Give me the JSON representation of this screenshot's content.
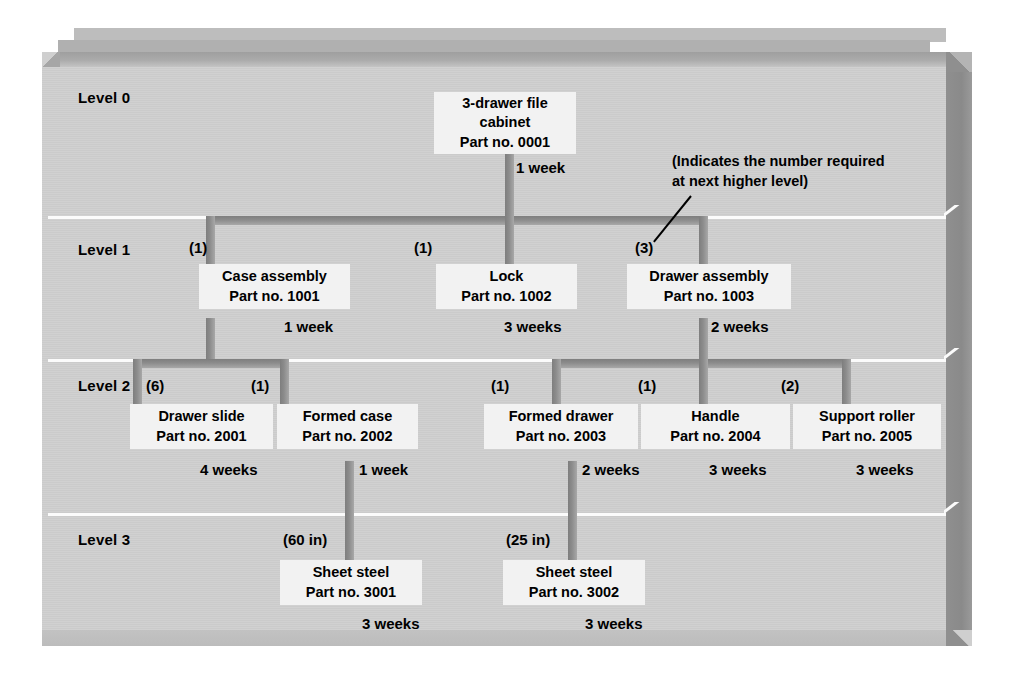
{
  "diagram": {
    "annotation": {
      "line1": "(Indicates the number required",
      "line2": "at next higher level)"
    },
    "levels": [
      {
        "label": "Level 0"
      },
      {
        "label": "Level 1"
      },
      {
        "label": "Level 2"
      },
      {
        "label": "Level 3"
      }
    ],
    "nodes": [
      {
        "id": "n0001",
        "level": 0,
        "name": "3-drawer file",
        "name2": "cabinet",
        "part": "Part no. 0001",
        "qty": "",
        "lead_time": "1 week"
      },
      {
        "id": "n1001",
        "level": 1,
        "name": "Case assembly",
        "name2": "",
        "part": "Part no. 1001",
        "qty": "(1)",
        "lead_time": "1 week"
      },
      {
        "id": "n1002",
        "level": 1,
        "name": "Lock",
        "name2": "",
        "part": "Part no. 1002",
        "qty": "(1)",
        "lead_time": "3 weeks"
      },
      {
        "id": "n1003",
        "level": 1,
        "name": "Drawer assembly",
        "name2": "",
        "part": "Part no. 1003",
        "qty": "(3)",
        "lead_time": "2 weeks"
      },
      {
        "id": "n2001",
        "level": 2,
        "name": "Drawer slide",
        "name2": "",
        "part": "Part no. 2001",
        "qty": "(6)",
        "lead_time": "4 weeks"
      },
      {
        "id": "n2002",
        "level": 2,
        "name": "Formed case",
        "name2": "",
        "part": "Part no. 2002",
        "qty": "(1)",
        "lead_time": "1 week"
      },
      {
        "id": "n2003",
        "level": 2,
        "name": "Formed drawer",
        "name2": "",
        "part": "Part no. 2003",
        "qty": "(1)",
        "lead_time": "2 weeks"
      },
      {
        "id": "n2004",
        "level": 2,
        "name": "Handle",
        "name2": "",
        "part": "Part no. 2004",
        "qty": "(1)",
        "lead_time": "3 weeks"
      },
      {
        "id": "n2005",
        "level": 2,
        "name": "Support roller",
        "name2": "",
        "part": "Part no. 2005",
        "qty": "(2)",
        "lead_time": "3 weeks"
      },
      {
        "id": "n3001",
        "level": 3,
        "name": "Sheet steel",
        "name2": "",
        "part": "Part no. 3001",
        "qty": "(60 in)",
        "lead_time": "3 weeks"
      },
      {
        "id": "n3002",
        "level": 3,
        "name": "Sheet steel",
        "name2": "",
        "part": "Part no. 3002",
        "qty": "(25 in)",
        "lead_time": "3 weeks"
      }
    ],
    "colors": {
      "panel": "#cfcfcf",
      "box_fill": "#f2f2f2",
      "connector": "#8c8c8c",
      "divider": "#fbfbfb",
      "text": "#000000",
      "frame_side": "#8f8f8f"
    }
  }
}
